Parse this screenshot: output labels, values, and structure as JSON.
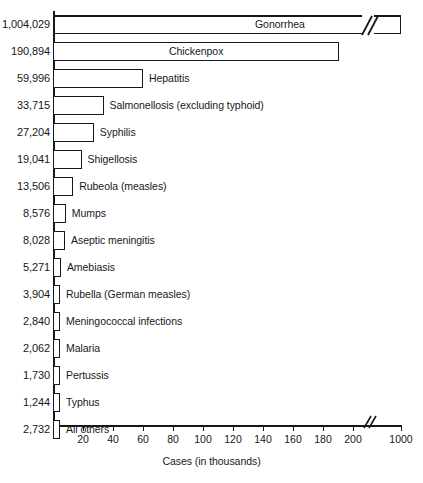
{
  "chart_data": {
    "type": "bar",
    "orientation": "horizontal",
    "title": "",
    "xlabel": "Cases (in thousands)",
    "ylabel": "",
    "xlim": [
      0,
      200
    ],
    "grid": false,
    "legend": "none",
    "axis_break": {
      "present": true,
      "between": [
        200,
        1000
      ],
      "note": "x-axis is broken between 200 and 1000 thousand"
    },
    "units": "cases",
    "tick_labels": [
      "20",
      "40",
      "60",
      "80",
      "100",
      "120",
      "140",
      "160",
      "180",
      "200",
      "1000"
    ],
    "tick_values": [
      20,
      40,
      60,
      80,
      100,
      120,
      140,
      160,
      180,
      200,
      1000
    ],
    "categories": [
      "Gonorrhea",
      "Chickenpox",
      "Hepatitis",
      "Salmonellosis (excluding typhoid)",
      "Syphilis",
      "Shigellosis",
      "Rubeola (measles)",
      "Mumps",
      "Aseptic meningitis",
      "Amebiasis",
      "Rubella (German measles)",
      "Meningococcal infections",
      "Malaria",
      "Pertussis",
      "Typhus",
      "All others"
    ],
    "values": [
      1004029,
      190894,
      59996,
      33715,
      27204,
      19041,
      13506,
      8576,
      8028,
      5271,
      3904,
      2840,
      2062,
      1730,
      1244,
      2732
    ],
    "value_labels": [
      "1,004,029",
      "190,894",
      "59,996",
      "33,715",
      "27,204",
      "19,041",
      "13,506",
      "8,576",
      "8,028",
      "5,271",
      "3,904",
      "2,840",
      "2,062",
      "1,730",
      "1,244",
      "2,732"
    ]
  },
  "rows": [
    {
      "value_label": "1,004,029",
      "name": "Gonorrhea",
      "label_placement": "inside"
    },
    {
      "value_label": "190,894",
      "name": "Chickenpox",
      "label_placement": "inside"
    },
    {
      "value_label": "59,996",
      "name": "Hepatitis",
      "label_placement": "outside"
    },
    {
      "value_label": "33,715",
      "name": "Salmonellosis (excluding typhoid)",
      "label_placement": "outside"
    },
    {
      "value_label": "27,204",
      "name": "Syphilis",
      "label_placement": "outside"
    },
    {
      "value_label": "19,041",
      "name": "Shigellosis",
      "label_placement": "outside"
    },
    {
      "value_label": "13,506",
      "name": "Rubeola (measles)",
      "label_placement": "outside"
    },
    {
      "value_label": "8,576",
      "name": "Mumps",
      "label_placement": "outside"
    },
    {
      "value_label": "8,028",
      "name": "Aseptic meningitis",
      "label_placement": "outside"
    },
    {
      "value_label": "5,271",
      "name": "Amebiasis",
      "label_placement": "outside"
    },
    {
      "value_label": "3,904",
      "name": "Rubella (German measles)",
      "label_placement": "outside"
    },
    {
      "value_label": "2,840",
      "name": "Meningococcal infections",
      "label_placement": "outside"
    },
    {
      "value_label": "2,062",
      "name": "Malaria",
      "label_placement": "outside"
    },
    {
      "value_label": "1,730",
      "name": "Pertussis",
      "label_placement": "outside"
    },
    {
      "value_label": "1,244",
      "name": "Typhus",
      "label_placement": "outside"
    },
    {
      "value_label": "2,732",
      "name": "All others",
      "label_placement": "outside"
    }
  ],
  "axis": {
    "x_title": "Cases (in thousands)",
    "ticks": [
      "20",
      "40",
      "60",
      "80",
      "100",
      "120",
      "140",
      "160",
      "180",
      "200",
      "1000"
    ]
  },
  "colors": {
    "ink": "#16181a",
    "background": "#ffffff"
  }
}
